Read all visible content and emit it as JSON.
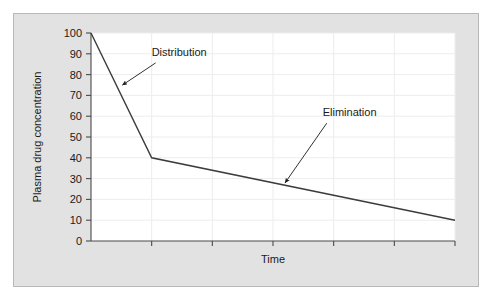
{
  "figure": {
    "panel_bg_color": "#e2e2e2",
    "panel_border_color": "#b8b8b8",
    "plot_bg_color": "#ffffff",
    "grid_color": "#ededed",
    "axis_color": "#4a4a4a",
    "line_color": "#3c3c3c",
    "text_color": "#1a1a1a"
  },
  "chart_data": {
    "type": "line",
    "title": "",
    "xlabel": "Time",
    "ylabel": "Plasma drug concentration",
    "x": [
      0,
      1,
      6
    ],
    "values": [
      100,
      40,
      10
    ],
    "series": [
      {
        "name": "Plasma drug concentration",
        "x": [
          0,
          1,
          6
        ],
        "values": [
          100,
          40,
          10
        ]
      }
    ],
    "xlim": [
      0,
      6
    ],
    "ylim": [
      0,
      100
    ],
    "xticks": [
      0,
      1,
      2,
      3,
      4,
      5,
      6
    ],
    "xtick_labels": [
      "",
      "",
      "",
      "",
      "",
      "",
      ""
    ],
    "yticks": [
      0,
      10,
      20,
      30,
      40,
      50,
      60,
      70,
      80,
      90,
      100
    ],
    "ytick_labels": [
      "0",
      "10",
      "20",
      "30",
      "40",
      "50",
      "60",
      "70",
      "80",
      "90",
      "100"
    ],
    "grid": true,
    "legend": "none",
    "annotations": [
      {
        "text": "Distribution",
        "label_x": 1.0,
        "label_y": 89,
        "point_x": 0.52,
        "point_y": 75
      },
      {
        "text": "Elimination",
        "label_x": 3.82,
        "label_y": 60,
        "point_x": 3.2,
        "point_y": 28
      }
    ]
  }
}
